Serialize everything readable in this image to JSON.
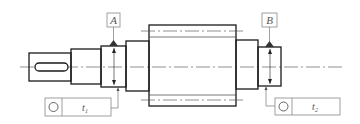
{
  "figure": {
    "type": "technical drawing",
    "colors": {
      "outline": "#1a1a1a",
      "annotation": "#888888",
      "background": "#ffffff"
    }
  },
  "datums": [
    {
      "id": "datum-a",
      "label": "A"
    },
    {
      "id": "datum-b",
      "label": "B"
    }
  ],
  "tolerance_frames": [
    {
      "id": "frame-1",
      "symbol": "circular-runout-icon",
      "symbol_glyph": "○",
      "value": "t",
      "subscript": "1"
    },
    {
      "id": "frame-2",
      "symbol": "circular-runout-icon",
      "symbol_glyph": "○",
      "value": "t",
      "subscript": "2"
    }
  ]
}
